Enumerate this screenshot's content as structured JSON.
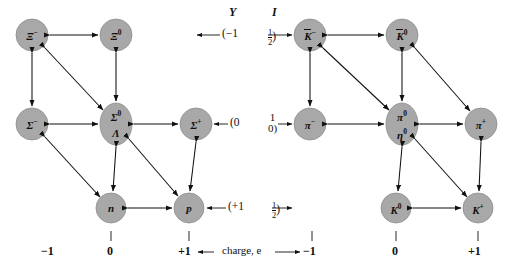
{
  "figure": {
    "type": "su3-weight-diagrams",
    "axis_caption": "charge, e",
    "column_headers": {
      "hypercharge": "Y",
      "isospin": "I"
    }
  },
  "quantum_numbers": [
    {
      "row": "top",
      "Y": "(−1",
      "I_num": "1",
      "I_den": "2",
      "I_stacked": null
    },
    {
      "row": "middle",
      "Y": "(0",
      "I_num": null,
      "I_den": null,
      "I_stacked": [
        "1",
        "0)"
      ]
    },
    {
      "row": "bottom",
      "Y": "(+1",
      "I_num": "1",
      "I_den": "2",
      "I_stacked": null
    }
  ],
  "left_diagram": {
    "name": "baryon-octet",
    "charge_ticks": [
      "−1",
      "0",
      "+1"
    ],
    "nodes": [
      {
        "id": "xi-minus",
        "label": "Ξ",
        "sup": "−",
        "overbar": false,
        "row": 0,
        "col": 0
      },
      {
        "id": "xi-zero",
        "label": "Ξ",
        "sup": "0",
        "overbar": false,
        "row": 0,
        "col": 1
      },
      {
        "id": "sigma-minus",
        "label": "Σ",
        "sup": "−",
        "overbar": false,
        "row": 1,
        "col": 0
      },
      {
        "id": "sigma-zero-lambda",
        "label": "Σ",
        "sup": "0",
        "label2": "Λ",
        "overbar": false,
        "row": 1,
        "col": 1
      },
      {
        "id": "sigma-plus",
        "label": "Σ",
        "sup": "+",
        "overbar": false,
        "row": 1,
        "col": 2
      },
      {
        "id": "neutron",
        "label": "n",
        "sup": "",
        "overbar": false,
        "row": 2,
        "col": 1
      },
      {
        "id": "proton",
        "label": "p",
        "sup": "",
        "overbar": false,
        "row": 2,
        "col": 2
      }
    ]
  },
  "right_diagram": {
    "name": "meson-octet",
    "charge_ticks": [
      "−1",
      "0",
      "+1"
    ],
    "nodes": [
      {
        "id": "k-minus-bar",
        "label": "K",
        "sup": "−",
        "overbar": true,
        "row": 0,
        "col": 0
      },
      {
        "id": "k-zero-bar",
        "label": "K",
        "sup": "0",
        "overbar": true,
        "row": 0,
        "col": 1
      },
      {
        "id": "pi-minus",
        "label": "π",
        "sup": "−",
        "overbar": false,
        "row": 1,
        "col": 0
      },
      {
        "id": "pi-zero-eta-zero",
        "label": "π",
        "sup": "0",
        "label2": "η",
        "sup2": "0",
        "overbar": false,
        "row": 1,
        "col": 1
      },
      {
        "id": "pi-plus",
        "label": "π",
        "sup": "+",
        "overbar": false,
        "row": 1,
        "col": 2
      },
      {
        "id": "k-zero",
        "label": "K",
        "sup": "0",
        "overbar": false,
        "row": 2,
        "col": 1
      },
      {
        "id": "k-plus",
        "label": "K",
        "sup": "+",
        "overbar": false,
        "row": 2,
        "col": 2
      }
    ]
  }
}
